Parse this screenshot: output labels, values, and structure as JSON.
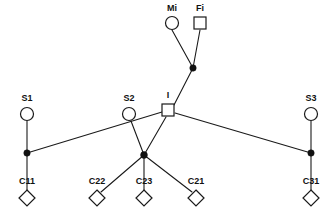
{
  "diagram": {
    "type": "pedigree-network-diagram",
    "background_color": "#ffffff",
    "stroke_color": "#1a1a1a",
    "fill_color": "#ffffff",
    "dot_color": "#111111",
    "width": 336,
    "height": 219,
    "nodes": [
      {
        "id": "Mi",
        "label": "Mi",
        "shape": "circle",
        "x": 172,
        "y": 23,
        "r": 6.5,
        "label_x": 172,
        "label_y": 11
      },
      {
        "id": "Fi",
        "label": "Fi",
        "shape": "square",
        "x": 200,
        "y": 23,
        "size": 12,
        "label_x": 200,
        "label_y": 11
      },
      {
        "id": "I",
        "label": "I",
        "shape": "square",
        "x": 168,
        "y": 110,
        "size": 12,
        "label_x": 168,
        "label_y": 98
      },
      {
        "id": "S1",
        "label": "S1",
        "shape": "circle",
        "x": 27,
        "y": 114,
        "r": 6.5,
        "label_x": 27,
        "label_y": 101
      },
      {
        "id": "S2",
        "label": "S2",
        "shape": "circle",
        "x": 129,
        "y": 114,
        "r": 6.5,
        "label_x": 129,
        "label_y": 101
      },
      {
        "id": "S3",
        "label": "S3",
        "shape": "circle",
        "x": 311,
        "y": 114,
        "r": 6.5,
        "label_x": 311,
        "label_y": 101
      },
      {
        "id": "C11",
        "label": "C11",
        "shape": "diamond",
        "x": 27,
        "y": 198,
        "size": 8,
        "label_x": 27,
        "label_y": 184
      },
      {
        "id": "C22",
        "label": "C22",
        "shape": "diamond",
        "x": 97,
        "y": 198,
        "size": 8,
        "label_x": 97,
        "label_y": 184
      },
      {
        "id": "C23",
        "label": "C23",
        "shape": "diamond",
        "x": 144,
        "y": 198,
        "size": 8,
        "label_x": 144,
        "label_y": 184
      },
      {
        "id": "C21",
        "label": "C21",
        "shape": "diamond",
        "x": 196,
        "y": 198,
        "size": 8,
        "label_x": 196,
        "label_y": 184
      },
      {
        "id": "C31",
        "label": "C31",
        "shape": "diamond",
        "x": 311,
        "y": 198,
        "size": 8,
        "label_x": 311,
        "label_y": 184
      }
    ],
    "junctions": [
      {
        "id": "J-top",
        "x": 193,
        "y": 68,
        "r": 3.2
      },
      {
        "id": "J-left",
        "x": 27,
        "y": 153,
        "r": 3.2
      },
      {
        "id": "J-mid",
        "x": 144,
        "y": 155,
        "r": 3.4
      },
      {
        "id": "J-right",
        "x": 311,
        "y": 153,
        "r": 3.2
      }
    ],
    "edges": [
      {
        "id": "Mi-Jtop",
        "from": "Mi",
        "x1": 172,
        "y1": 30,
        "x2": 193,
        "y2": 68
      },
      {
        "id": "Fi-Jtop",
        "from": "Fi",
        "x1": 200,
        "y1": 30,
        "x2": 193,
        "y2": 68
      },
      {
        "id": "Jtop-I",
        "from": "J-top",
        "x1": 193,
        "y1": 68,
        "x2": 174,
        "y2": 105
      },
      {
        "id": "S1-Jleft",
        "from": "S1",
        "x1": 27,
        "y1": 121,
        "x2": 27,
        "y2": 153
      },
      {
        "id": "Jleft-C11",
        "from": "J-left",
        "x1": 27,
        "y1": 153,
        "x2": 27,
        "y2": 190
      },
      {
        "id": "I-Jleft",
        "from": "I",
        "x1": 162,
        "y1": 112,
        "x2": 27,
        "y2": 153
      },
      {
        "id": "S2-Jmid",
        "from": "S2",
        "x1": 131,
        "y1": 121,
        "x2": 144,
        "y2": 155
      },
      {
        "id": "I-Jmid",
        "from": "I",
        "x1": 166,
        "y1": 117,
        "x2": 144,
        "y2": 155
      },
      {
        "id": "Jmid-C22",
        "from": "J-mid",
        "x1": 144,
        "y1": 155,
        "x2": 101,
        "y2": 192
      },
      {
        "id": "Jmid-C23",
        "from": "J-mid",
        "x1": 144,
        "y1": 155,
        "x2": 144,
        "y2": 190
      },
      {
        "id": "Jmid-C21",
        "from": "J-mid",
        "x1": 144,
        "y1": 155,
        "x2": 192,
        "y2": 192
      },
      {
        "id": "I-Jright",
        "from": "I",
        "x1": 175,
        "y1": 113,
        "x2": 311,
        "y2": 153
      },
      {
        "id": "S3-Jright",
        "from": "S3",
        "x1": 311,
        "y1": 121,
        "x2": 311,
        "y2": 153
      },
      {
        "id": "Jright-C31",
        "from": "J-right",
        "x1": 311,
        "y1": 153,
        "x2": 311,
        "y2": 190
      }
    ]
  }
}
